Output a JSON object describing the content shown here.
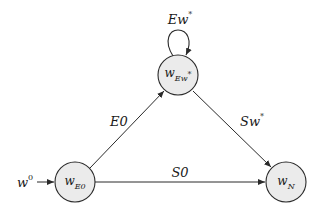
{
  "diagram": {
    "type": "state-transition-graph",
    "colors": {
      "node_fill": "#ebebeb",
      "stroke": "#2a2a2a",
      "text": "#1a1a1a"
    },
    "nodes": [
      {
        "id": "wE0",
        "base": "w",
        "sub": "E0",
        "sub_star": "",
        "cx": 75,
        "cy": 182,
        "r": 20
      },
      {
        "id": "wEw",
        "base": "w",
        "sub": "Ew",
        "sub_star": "*",
        "cx": 178,
        "cy": 75,
        "r": 20
      },
      {
        "id": "wN",
        "base": "w",
        "sub": "N",
        "sub_star": "",
        "cx": 286,
        "cy": 182,
        "r": 20
      }
    ],
    "initial": {
      "base": "w",
      "sup": "0",
      "target": "wE0"
    },
    "edges": [
      {
        "from": "wE0",
        "to": "wEw",
        "label_main": "E0",
        "label_star": ""
      },
      {
        "from": "wEw",
        "to": "wN",
        "label_main": "Sw",
        "label_star": "*"
      },
      {
        "from": "wE0",
        "to": "wN",
        "label_main": "S0",
        "label_star": ""
      },
      {
        "from": "wEw",
        "to": "wEw",
        "label_main": "Ew",
        "label_star": "*",
        "self_loop": true
      }
    ]
  }
}
